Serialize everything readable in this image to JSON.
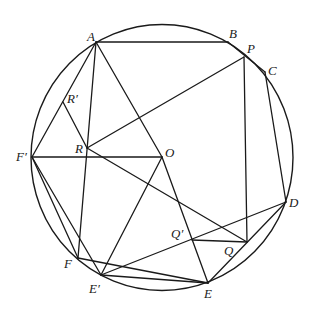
{
  "diagram": {
    "type": "geometry-circle-construction",
    "width": 313,
    "height": 311,
    "circle": {
      "cx": 162,
      "cy": 157.5,
      "rx": 131,
      "ry": 133
    },
    "points": [
      {
        "id": "A",
        "label": "A",
        "x": 96,
        "y": 42,
        "lx": 87,
        "ly": 41
      },
      {
        "id": "B",
        "label": "B",
        "x": 228,
        "y": 42,
        "lx": 229,
        "ly": 38
      },
      {
        "id": "P",
        "label": "P",
        "x": 244,
        "y": 57,
        "lx": 247,
        "ly": 53
      },
      {
        "id": "C",
        "label": "C",
        "x": 265,
        "y": 72,
        "lx": 268,
        "ly": 75
      },
      {
        "id": "Rp",
        "label": "R′",
        "x": 63,
        "y": 102,
        "lx": 67,
        "ly": 103
      },
      {
        "id": "R",
        "label": "R",
        "x": 87,
        "y": 148,
        "lx": 75,
        "ly": 153
      },
      {
        "id": "O",
        "label": "O",
        "x": 162,
        "y": 157,
        "lx": 165,
        "ly": 157
      },
      {
        "id": "Fp",
        "label": "F′",
        "x": 32,
        "y": 157,
        "lx": 16,
        "ly": 161
      },
      {
        "id": "D",
        "label": "D",
        "x": 286,
        "y": 202,
        "lx": 289,
        "ly": 207
      },
      {
        "id": "Qp",
        "label": "Q′",
        "x": 192,
        "y": 240,
        "lx": 171,
        "ly": 238
      },
      {
        "id": "Q",
        "label": "Q",
        "x": 247,
        "y": 242,
        "lx": 224,
        "ly": 255
      },
      {
        "id": "F",
        "label": "F",
        "x": 78,
        "y": 258,
        "lx": 64,
        "ly": 268
      },
      {
        "id": "Ep",
        "label": "E′",
        "x": 101,
        "y": 275,
        "lx": 89,
        "ly": 293
      },
      {
        "id": "E",
        "label": "E",
        "x": 208,
        "y": 283,
        "lx": 204,
        "ly": 298
      }
    ],
    "segments": [
      [
        "A",
        "B"
      ],
      [
        "B",
        "C"
      ],
      [
        "A",
        "Fp"
      ],
      [
        "A",
        "F"
      ],
      [
        "A",
        "O"
      ],
      [
        "Rp",
        "R"
      ],
      [
        "R",
        "P"
      ],
      [
        "R",
        "Q"
      ],
      [
        "Fp",
        "O"
      ],
      [
        "Fp",
        "F"
      ],
      [
        "Fp",
        "Ep"
      ],
      [
        "F",
        "E"
      ],
      [
        "Ep",
        "E"
      ],
      [
        "Ep",
        "O"
      ],
      [
        "Ep",
        "D"
      ],
      [
        "O",
        "E"
      ],
      [
        "P",
        "Q"
      ],
      [
        "C",
        "D"
      ],
      [
        "D",
        "E"
      ],
      [
        "Qp",
        "Q"
      ]
    ]
  }
}
